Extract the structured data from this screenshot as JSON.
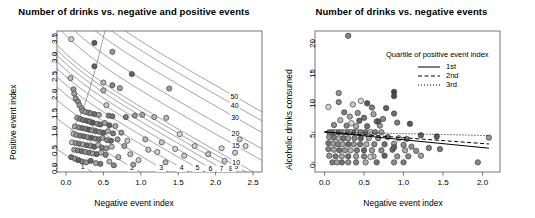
{
  "figure": {
    "background": "#ffffff",
    "point_outline": "#404040",
    "contour_color": "#777777",
    "axis_color": "#555555"
  },
  "chart_data": [
    {
      "id": "left",
      "type": "scatter",
      "title": "Number of drinks vs. negative and positive events",
      "xlabel": "Negative event index",
      "ylabel": "Positive event index",
      "xlim": [
        -0.12,
        2.62
      ],
      "ylim": [
        -0.18,
        3.62
      ],
      "xticks": [
        0.0,
        0.5,
        1.0,
        1.5,
        2.0,
        2.5
      ],
      "xticklabels": [
        "0.0",
        "0.5",
        "1.0",
        "1.5",
        "2.0",
        "2.5"
      ],
      "yticks": [
        0.0,
        0.5,
        1.0,
        1.5,
        2.0,
        2.5,
        3.0,
        3.5
      ],
      "yticklabels": [
        "0.0",
        "0.5",
        "1.0",
        "1.5",
        "2.0",
        "2.5",
        "3.0",
        "3.5"
      ],
      "grid": false,
      "overlay": "contour",
      "contour_levels": [
        1,
        2,
        3,
        4,
        5,
        6,
        7,
        8,
        9,
        10,
        15,
        20,
        30,
        40,
        50
      ],
      "contour_labels": [
        "1",
        "2",
        "3",
        "4",
        "5",
        "6",
        "7",
        "8",
        "9",
        "10",
        "15",
        "20",
        "30",
        "40",
        "50"
      ],
      "points": [
        [
          0.07,
          3.4,
          0.82
        ],
        [
          0.38,
          3.3,
          0.25
        ],
        [
          0.38,
          2.67,
          0.3
        ],
        [
          0.06,
          2.35,
          0.72
        ],
        [
          0.62,
          3.06,
          0.55
        ],
        [
          0.88,
          2.46,
          0.3
        ],
        [
          0.1,
          2.05,
          0.55
        ],
        [
          0.11,
          1.93,
          0.6
        ],
        [
          0.5,
          2.23,
          0.7
        ],
        [
          0.5,
          2.02,
          0.68
        ],
        [
          0.62,
          2.16,
          0.45
        ],
        [
          0.72,
          2.08,
          0.6
        ],
        [
          0.13,
          1.8,
          0.55
        ],
        [
          0.16,
          1.72,
          0.52
        ],
        [
          0.18,
          1.62,
          0.58
        ],
        [
          0.21,
          1.53,
          0.62
        ],
        [
          0.54,
          1.62,
          0.78
        ],
        [
          1.38,
          2.07,
          0.58
        ],
        [
          0.22,
          1.47,
          0.55
        ],
        [
          0.26,
          1.44,
          0.6
        ],
        [
          0.3,
          1.42,
          0.48
        ],
        [
          0.33,
          1.4,
          0.5
        ],
        [
          0.38,
          1.38,
          0.35
        ],
        [
          0.44,
          1.36,
          0.6
        ],
        [
          0.57,
          1.34,
          0.45
        ],
        [
          0.62,
          1.32,
          0.38
        ],
        [
          0.8,
          1.3,
          0.4
        ],
        [
          0.92,
          1.34,
          0.55
        ],
        [
          1.02,
          1.36,
          0.62
        ],
        [
          1.18,
          1.3,
          0.7
        ],
        [
          1.34,
          1.28,
          0.72
        ],
        [
          0.15,
          1.28,
          0.58
        ],
        [
          0.19,
          1.25,
          0.45
        ],
        [
          0.23,
          1.22,
          0.4
        ],
        [
          0.28,
          1.2,
          0.32
        ],
        [
          0.32,
          1.18,
          0.42
        ],
        [
          0.36,
          1.15,
          0.25
        ],
        [
          0.42,
          1.12,
          0.52
        ],
        [
          0.46,
          1.1,
          0.35
        ],
        [
          0.52,
          1.14,
          0.58
        ],
        [
          0.58,
          1.08,
          0.3
        ],
        [
          0.66,
          1.06,
          0.62
        ],
        [
          0.12,
          1.05,
          0.62
        ],
        [
          0.17,
          1.02,
          0.5
        ],
        [
          0.22,
          1.0,
          0.38
        ],
        [
          0.27,
          0.98,
          0.45
        ],
        [
          0.31,
          0.96,
          0.28
        ],
        [
          0.35,
          0.94,
          0.55
        ],
        [
          0.4,
          0.92,
          0.35
        ],
        [
          0.45,
          0.9,
          0.48
        ],
        [
          0.5,
          0.88,
          0.3
        ],
        [
          0.56,
          0.92,
          0.65
        ],
        [
          0.63,
          0.86,
          0.42
        ],
        [
          0.74,
          0.88,
          0.55
        ],
        [
          0.1,
          0.85,
          0.7
        ],
        [
          0.14,
          0.82,
          0.55
        ],
        [
          0.19,
          0.8,
          0.42
        ],
        [
          0.24,
          0.78,
          0.35
        ],
        [
          0.29,
          0.76,
          0.5
        ],
        [
          0.34,
          0.74,
          0.28
        ],
        [
          0.39,
          0.72,
          0.45
        ],
        [
          0.44,
          0.7,
          0.38
        ],
        [
          0.49,
          0.74,
          0.6
        ],
        [
          0.55,
          0.68,
          0.48
        ],
        [
          0.6,
          0.66,
          0.32
        ],
        [
          0.69,
          0.7,
          0.58
        ],
        [
          0.08,
          0.62,
          0.78
        ],
        [
          0.13,
          0.6,
          0.52
        ],
        [
          0.18,
          0.58,
          0.4
        ],
        [
          0.23,
          0.56,
          0.62
        ],
        [
          0.28,
          0.54,
          0.35
        ],
        [
          0.33,
          0.52,
          0.48
        ],
        [
          0.38,
          0.5,
          0.3
        ],
        [
          0.43,
          0.55,
          0.68
        ],
        [
          0.48,
          0.48,
          0.42
        ],
        [
          0.54,
          0.46,
          0.55
        ],
        [
          0.61,
          0.5,
          0.72
        ],
        [
          0.78,
          0.52,
          0.6
        ],
        [
          0.11,
          0.42,
          0.58
        ],
        [
          0.16,
          0.4,
          0.45
        ],
        [
          0.21,
          0.38,
          0.35
        ],
        [
          0.26,
          0.36,
          0.52
        ],
        [
          0.31,
          0.34,
          0.4
        ],
        [
          0.36,
          0.32,
          0.6
        ],
        [
          0.41,
          0.3,
          0.32
        ],
        [
          0.47,
          0.34,
          0.68
        ],
        [
          0.53,
          0.28,
          0.45
        ],
        [
          0.07,
          0.22,
          0.35
        ],
        [
          0.12,
          0.18,
          0.5
        ],
        [
          0.17,
          0.14,
          0.28
        ],
        [
          0.22,
          0.1,
          0.42
        ],
        [
          0.27,
          0.08,
          0.55
        ],
        [
          0.33,
          0.12,
          0.3
        ],
        [
          0.4,
          0.06,
          0.62
        ],
        [
          0.46,
          0.04,
          0.38
        ],
        [
          0.58,
          0.1,
          0.72
        ],
        [
          0.7,
          0.22,
          0.68
        ],
        [
          0.86,
          0.3,
          0.75
        ],
        [
          0.97,
          0.14,
          0.8
        ],
        [
          1.1,
          0.42,
          0.78
        ],
        [
          1.22,
          0.36,
          0.82
        ],
        [
          1.33,
          0.08,
          0.7
        ],
        [
          1.46,
          0.44,
          0.85
        ],
        [
          1.58,
          0.26,
          0.8
        ],
        [
          1.72,
          0.52,
          0.82
        ],
        [
          1.9,
          0.3,
          0.78
        ],
        [
          2.08,
          0.46,
          0.85
        ],
        [
          2.26,
          0.34,
          0.8
        ],
        [
          2.4,
          0.52,
          0.83
        ],
        [
          1.06,
          0.7,
          0.72
        ],
        [
          1.28,
          0.62,
          0.78
        ],
        [
          0.9,
          0.02,
          0.6
        ],
        [
          0.64,
          0.0,
          0.48
        ],
        [
          0.82,
          0.66,
          0.8
        ],
        [
          1.52,
          0.84,
          0.85
        ],
        [
          2.32,
          0.7,
          0.82
        ],
        [
          2.12,
          0.12,
          0.8
        ]
      ]
    },
    {
      "id": "right",
      "type": "scatter",
      "title": "Number of drinks vs. negative events",
      "xlabel": "Negative event index",
      "ylabel": "Alcoholic drinks consumed",
      "xlim": [
        -0.12,
        2.22
      ],
      "ylim": [
        -1.6,
        21.8
      ],
      "xticks": [
        0.0,
        0.5,
        1.0,
        1.5,
        2.0
      ],
      "xticklabels": [
        "0.0",
        "0.5",
        "1.0",
        "1.5",
        "2.0"
      ],
      "yticks": [
        0,
        5,
        10,
        15,
        20
      ],
      "yticklabels": [
        "0",
        "5",
        "10",
        "15",
        "20"
      ],
      "grid": false,
      "legend": {
        "title": "Quartile of positive event index",
        "position": "top-right",
        "entries": [
          {
            "label": "1st",
            "style": "solid"
          },
          {
            "label": "2nd",
            "style": "dashed"
          },
          {
            "label": "3rd",
            "style": "dotted"
          }
        ]
      },
      "series": [
        {
          "name": "1st",
          "style": "solid",
          "line": [
            [
              0.0,
              5.05
            ],
            [
              2.08,
              2.35
            ]
          ]
        },
        {
          "name": "2nd",
          "style": "dashed",
          "line": [
            [
              0.0,
              5.05
            ],
            [
              2.08,
              3.05
            ]
          ]
        },
        {
          "name": "3rd",
          "style": "dotted",
          "line": [
            [
              0.0,
              5.05
            ],
            [
              2.08,
              4.45
            ]
          ]
        }
      ],
      "points": [
        [
          0.3,
          21.0,
          0.45
        ],
        [
          0.18,
          11.5,
          0.55
        ],
        [
          0.88,
          11.7,
          0.15
        ],
        [
          0.88,
          11.0,
          0.18
        ],
        [
          0.05,
          9.2,
          0.85
        ],
        [
          0.36,
          9.6,
          0.8
        ],
        [
          0.6,
          9.1,
          0.45
        ],
        [
          0.18,
          10.0,
          0.48
        ],
        [
          0.25,
          8.3,
          0.4
        ],
        [
          0.42,
          8.2,
          0.55
        ],
        [
          0.62,
          8.0,
          0.6
        ],
        [
          0.88,
          8.1,
          0.35
        ],
        [
          0.32,
          7.6,
          0.62
        ],
        [
          0.5,
          7.4,
          0.38
        ],
        [
          0.74,
          7.2,
          0.5
        ],
        [
          0.2,
          7.0,
          0.7
        ],
        [
          0.44,
          6.9,
          0.3
        ],
        [
          0.66,
          6.8,
          0.58
        ],
        [
          0.92,
          6.6,
          0.42
        ],
        [
          1.08,
          6.4,
          0.25
        ],
        [
          0.12,
          6.2,
          0.52
        ],
        [
          0.28,
          6.1,
          0.45
        ],
        [
          0.4,
          6.0,
          0.65
        ],
        [
          0.54,
          6.0,
          0.35
        ],
        [
          0.7,
          6.1,
          0.55
        ],
        [
          0.34,
          6.5,
          0.88
        ],
        [
          0.06,
          5.0,
          0.48
        ],
        [
          0.1,
          5.0,
          0.4
        ],
        [
          0.14,
          5.0,
          0.62
        ],
        [
          0.18,
          5.0,
          0.35
        ],
        [
          0.22,
          5.0,
          0.55
        ],
        [
          0.26,
          5.0,
          0.7
        ],
        [
          0.3,
          5.0,
          0.42
        ],
        [
          0.34,
          5.0,
          0.58
        ],
        [
          0.38,
          5.0,
          0.3
        ],
        [
          0.42,
          5.0,
          0.66
        ],
        [
          0.46,
          5.0,
          0.5
        ],
        [
          0.52,
          5.0,
          0.38
        ],
        [
          0.58,
          5.0,
          0.72
        ],
        [
          0.64,
          5.0,
          0.45
        ],
        [
          0.72,
          5.0,
          0.6
        ],
        [
          0.06,
          4.2,
          0.55
        ],
        [
          0.12,
          4.1,
          0.42
        ],
        [
          0.18,
          4.0,
          0.65
        ],
        [
          0.24,
          4.0,
          0.35
        ],
        [
          0.3,
          4.0,
          0.58
        ],
        [
          0.38,
          4.0,
          0.48
        ],
        [
          0.46,
          4.0,
          0.3
        ],
        [
          0.56,
          4.0,
          0.62
        ],
        [
          0.68,
          4.0,
          0.52
        ],
        [
          0.8,
          4.2,
          0.4
        ],
        [
          0.94,
          4.0,
          0.68
        ],
        [
          1.04,
          3.9,
          0.45
        ],
        [
          0.05,
          3.2,
          0.38
        ],
        [
          0.11,
          3.1,
          0.58
        ],
        [
          0.17,
          3.0,
          0.45
        ],
        [
          0.23,
          3.0,
          0.62
        ],
        [
          0.3,
          3.0,
          0.32
        ],
        [
          0.37,
          3.0,
          0.55
        ],
        [
          0.45,
          3.0,
          0.4
        ],
        [
          0.53,
          3.0,
          0.68
        ],
        [
          0.63,
          3.0,
          0.48
        ],
        [
          0.76,
          3.0,
          0.35
        ],
        [
          0.88,
          3.1,
          0.6
        ],
        [
          1.0,
          2.9,
          0.5
        ],
        [
          0.05,
          2.2,
          0.45
        ],
        [
          0.12,
          2.1,
          0.62
        ],
        [
          0.19,
          2.0,
          0.38
        ],
        [
          0.26,
          2.0,
          0.55
        ],
        [
          0.33,
          2.0,
          0.7
        ],
        [
          0.41,
          2.0,
          0.42
        ],
        [
          0.5,
          2.0,
          0.3
        ],
        [
          0.6,
          2.0,
          0.58
        ],
        [
          0.72,
          2.0,
          0.48
        ],
        [
          0.86,
          2.1,
          0.35
        ],
        [
          1.02,
          2.0,
          0.65
        ],
        [
          1.16,
          1.9,
          0.52
        ],
        [
          0.06,
          1.1,
          0.55
        ],
        [
          0.14,
          1.0,
          0.4
        ],
        [
          0.22,
          1.0,
          0.62
        ],
        [
          0.3,
          1.0,
          0.35
        ],
        [
          0.4,
          1.0,
          0.58
        ],
        [
          0.5,
          1.0,
          0.45
        ],
        [
          0.62,
          1.0,
          0.7
        ],
        [
          0.76,
          1.1,
          0.3
        ],
        [
          0.92,
          1.0,
          0.55
        ],
        [
          1.06,
          1.0,
          0.48
        ],
        [
          1.22,
          1.1,
          0.62
        ],
        [
          0.1,
          0.0,
          0.42
        ],
        [
          0.16,
          0.0,
          0.58
        ],
        [
          0.22,
          0.0,
          0.35
        ],
        [
          0.3,
          0.0,
          0.52
        ],
        [
          0.4,
          0.0,
          0.45
        ],
        [
          0.52,
          0.0,
          0.65
        ],
        [
          0.66,
          0.0,
          0.38
        ],
        [
          0.88,
          0.0,
          0.5
        ],
        [
          1.0,
          0.0,
          0.42
        ],
        [
          1.94,
          0.0,
          0.48
        ],
        [
          0.68,
          6.8,
          0.22
        ],
        [
          1.22,
          4.5,
          0.3
        ],
        [
          1.42,
          4.3,
          0.25
        ],
        [
          2.08,
          4.1,
          0.55
        ],
        [
          1.32,
          2.4,
          0.45
        ],
        [
          1.46,
          2.2,
          0.4
        ],
        [
          0.88,
          2.5,
          0.28
        ],
        [
          1.1,
          2.6,
          0.52
        ],
        [
          0.78,
          9.0,
          0.3
        ],
        [
          0.46,
          10.2,
          0.88
        ],
        [
          0.54,
          9.8,
          0.25
        ],
        [
          0.58,
          0.9,
          0.82
        ]
      ]
    }
  ]
}
